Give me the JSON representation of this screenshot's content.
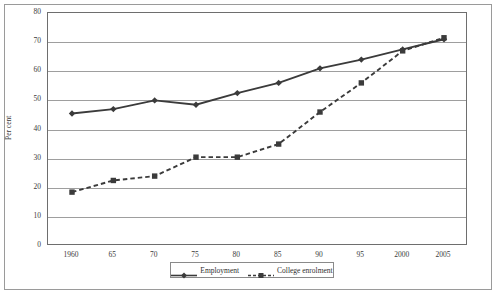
{
  "chart_data": {
    "type": "line",
    "title": "",
    "xlabel": "",
    "ylabel": "Per cent",
    "ylim": [
      0,
      80
    ],
    "yticks": [
      0,
      10,
      20,
      30,
      40,
      50,
      60,
      70,
      80
    ],
    "grid": true,
    "legend_position": "bottom",
    "categories": [
      "1960",
      "65",
      "70",
      "75",
      "80",
      "85",
      "90",
      "95",
      "2000",
      "2005"
    ],
    "series": [
      {
        "name": "Employment",
        "marker": "diamond",
        "line_style": "solid",
        "color": "#3b3b3b",
        "values": [
          45.5,
          47.0,
          50.0,
          48.5,
          52.5,
          56.0,
          61.0,
          64.0,
          67.5,
          71.0
        ]
      },
      {
        "name": "College enrolment",
        "marker": "square",
        "line_style": "dashed",
        "color": "#3b3b3b",
        "values": [
          18.5,
          22.5,
          24.0,
          30.5,
          30.5,
          35.0,
          46.0,
          56.0,
          67.0,
          71.5
        ]
      }
    ]
  },
  "axis": {
    "y_title": "Per cent"
  },
  "legend": {
    "entries": [
      {
        "label": "Employment"
      },
      {
        "label": "College enrolment"
      }
    ]
  }
}
